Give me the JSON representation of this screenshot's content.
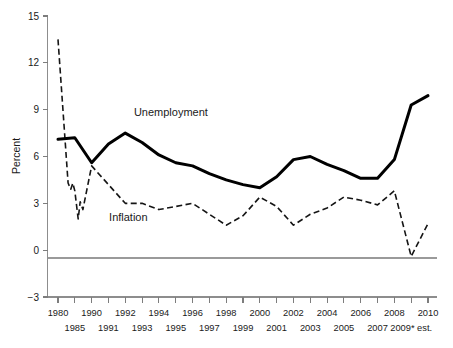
{
  "chart_data": {
    "type": "line",
    "title": "",
    "xlabel": "",
    "ylabel": "Percent",
    "ylim": [
      -3,
      15
    ],
    "yticks": [
      -3,
      0,
      3,
      6,
      9,
      12,
      15
    ],
    "ytick_labels": [
      "−3",
      "0",
      "3",
      "6",
      "9",
      "12",
      "15"
    ],
    "grid": false,
    "zero_line": true,
    "legend_position": "inline-annotations",
    "x": [
      1980,
      1985,
      1990,
      1991,
      1992,
      1993,
      1994,
      1995,
      1996,
      1997,
      1998,
      1999,
      2000,
      2001,
      2002,
      2003,
      2004,
      2005,
      2006,
      2007,
      2008,
      2009,
      2010
    ],
    "xtick_labels_top": [
      "1980",
      "1990",
      "1992",
      "1994",
      "1996",
      "1998",
      "2000",
      "2002",
      "2004",
      "2006",
      "2008",
      "2010"
    ],
    "xtick_labels_bottom": [
      "1985",
      "1991",
      "1993",
      "1995",
      "1997",
      "1999",
      "2001",
      "2003",
      "2005",
      "2007",
      "2009* est."
    ],
    "xtick_labels": [
      "1980",
      "1985",
      "1990",
      "1991",
      "1992",
      "1993",
      "1994",
      "1995",
      "1996",
      "1997",
      "1998",
      "1999",
      "2000",
      "2001",
      "2002",
      "2003",
      "2004",
      "2005",
      "2006",
      "2007",
      "2008",
      "2009* est.",
      "2010"
    ],
    "series": [
      {
        "name": "Unemployment",
        "style": "solid-thick",
        "color": "#000000",
        "label_x": 1994,
        "label_y": 8.6,
        "values": [
          7.1,
          7.2,
          5.6,
          6.8,
          7.5,
          6.9,
          6.1,
          5.6,
          5.4,
          4.9,
          4.5,
          4.2,
          4.0,
          4.7,
          5.8,
          6.0,
          5.5,
          5.1,
          4.6,
          4.6,
          5.8,
          9.3,
          9.9
        ]
      },
      {
        "name": "Inflation",
        "style": "dashed",
        "color": "#151515",
        "label_x": 1993,
        "label_y": 1.9,
        "values": [
          13.5,
          3.8,
          5.4,
          4.2,
          3.0,
          3.0,
          2.6,
          2.8,
          3.0,
          2.3,
          1.6,
          2.2,
          3.4,
          2.8,
          1.6,
          2.3,
          2.7,
          3.4,
          3.2,
          2.9,
          3.8,
          -0.4,
          1.7
        ]
      }
    ],
    "annotations": [
      {
        "text": "Unemployment",
        "x": 1994,
        "y": 8.6
      },
      {
        "text": "Inflation",
        "x": 1993,
        "y": 1.9
      }
    ]
  },
  "axis": {
    "y_title": "Percent"
  }
}
